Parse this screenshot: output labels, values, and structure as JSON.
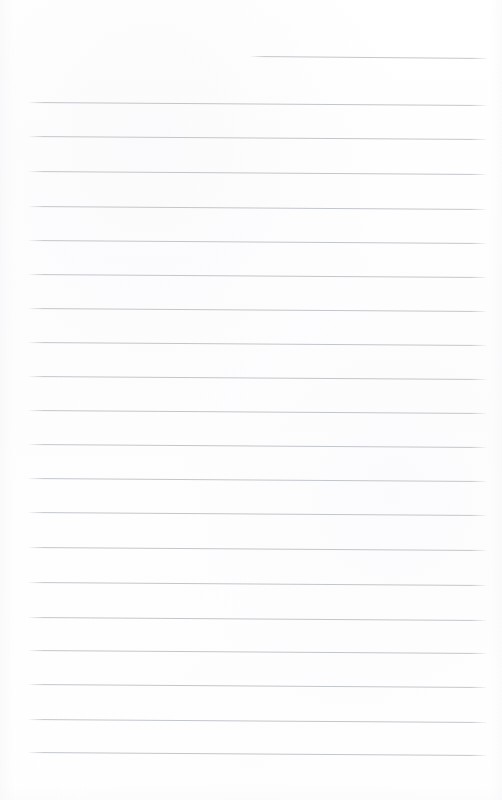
{
  "document": {
    "kind": "lined-notebook-page",
    "title": "Blank lined notebook page",
    "page_width": 502,
    "page_height": 800,
    "content_text": "",
    "is_blank": true,
    "paper_color": "#fefefe",
    "rule_color": "#bfc2c6",
    "rule_count": 21,
    "rule_thickness_px": 1,
    "left_margin_px": 28,
    "right_margin_px": 486,
    "line_spacing_px": 34.3,
    "slant_degrees": 0.38
  },
  "ruling": {
    "lines": [
      {
        "index": 1,
        "y": 56,
        "x_start": 250,
        "x_end": 487,
        "slant": 0.5,
        "short": true
      },
      {
        "index": 2,
        "y": 102,
        "x_start": 28,
        "x_end": 486,
        "slant": 0.38,
        "short": false
      },
      {
        "index": 3,
        "y": 136,
        "x_start": 28,
        "x_end": 486,
        "slant": 0.38,
        "short": false
      },
      {
        "index": 4,
        "y": 171,
        "x_start": 28,
        "x_end": 486,
        "slant": 0.38,
        "short": false
      },
      {
        "index": 5,
        "y": 206,
        "x_start": 28,
        "x_end": 486,
        "slant": 0.38,
        "short": false
      },
      {
        "index": 6,
        "y": 240,
        "x_start": 28,
        "x_end": 486,
        "slant": 0.38,
        "short": false
      },
      {
        "index": 7,
        "y": 274,
        "x_start": 28,
        "x_end": 486,
        "slant": 0.38,
        "short": false
      },
      {
        "index": 8,
        "y": 308,
        "x_start": 28,
        "x_end": 486,
        "slant": 0.38,
        "short": false
      },
      {
        "index": 9,
        "y": 342,
        "x_start": 28,
        "x_end": 486,
        "slant": 0.38,
        "short": false
      },
      {
        "index": 10,
        "y": 376,
        "x_start": 28,
        "x_end": 486,
        "slant": 0.38,
        "short": false
      },
      {
        "index": 11,
        "y": 410,
        "x_start": 28,
        "x_end": 486,
        "slant": 0.38,
        "short": false
      },
      {
        "index": 12,
        "y": 444,
        "x_start": 28,
        "x_end": 486,
        "slant": 0.38,
        "short": false
      },
      {
        "index": 13,
        "y": 478,
        "x_start": 28,
        "x_end": 486,
        "slant": 0.38,
        "short": false
      },
      {
        "index": 14,
        "y": 512,
        "x_start": 28,
        "x_end": 486,
        "slant": 0.38,
        "short": false
      },
      {
        "index": 15,
        "y": 547,
        "x_start": 28,
        "x_end": 486,
        "slant": 0.38,
        "short": false
      },
      {
        "index": 16,
        "y": 582,
        "x_start": 28,
        "x_end": 486,
        "slant": 0.38,
        "short": false
      },
      {
        "index": 17,
        "y": 617,
        "x_start": 28,
        "x_end": 486,
        "slant": 0.38,
        "short": false
      },
      {
        "index": 18,
        "y": 650,
        "x_start": 28,
        "x_end": 486,
        "slant": 0.38,
        "short": false
      },
      {
        "index": 19,
        "y": 684,
        "x_start": 28,
        "x_end": 486,
        "slant": 0.38,
        "short": false
      },
      {
        "index": 20,
        "y": 719,
        "x_start": 28,
        "x_end": 486,
        "slant": 0.38,
        "short": false
      },
      {
        "index": 21,
        "y": 752,
        "x_start": 28,
        "x_end": 486,
        "slant": 0.38,
        "short": false
      }
    ]
  }
}
